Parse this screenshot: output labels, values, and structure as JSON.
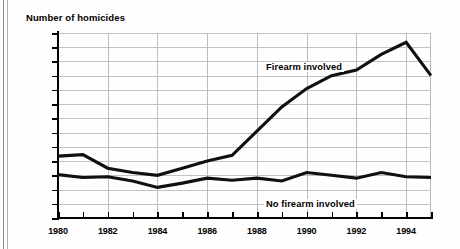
{
  "page": {
    "top_fragment_text": "",
    "title": "Number of homicides"
  },
  "chart_data": {
    "type": "line",
    "title": "Number of homicides",
    "xlabel": "",
    "ylabel": "Number of homicides",
    "x": [
      1980,
      1981,
      1982,
      1983,
      1984,
      1985,
      1986,
      1987,
      1988,
      1989,
      1990,
      1991,
      1992,
      1993,
      1994,
      1995
    ],
    "xlim": [
      1980,
      1995
    ],
    "ylim": [
      0,
      2600
    ],
    "ytick_labels": [
      "2,600",
      "2,400",
      "2,200",
      "2,000",
      "1,800",
      "1,600",
      "1,400",
      "1,200",
      "1,000",
      "800",
      "600",
      "400",
      "200",
      "0"
    ],
    "ytick_values": [
      2600,
      2400,
      2200,
      2000,
      1800,
      1600,
      1400,
      1200,
      1000,
      800,
      600,
      400,
      200,
      0
    ],
    "xtick_values": [
      1980,
      1981,
      1982,
      1983,
      1984,
      1985,
      1986,
      1987,
      1988,
      1989,
      1990,
      1991,
      1992,
      1993,
      1994,
      1995
    ],
    "xtick_labels": [
      "1980",
      "",
      "1982",
      "",
      "1984",
      "",
      "1986",
      "",
      "1988",
      "",
      "1990",
      "",
      "1992",
      "",
      "1994",
      ""
    ],
    "grid": true,
    "legend_position": "inline-annotations",
    "series": [
      {
        "name": "Firearm involved",
        "label_text": "Firearm involved",
        "values": [
          870,
          890,
          700,
          640,
          600,
          700,
          800,
          880,
          1220,
          1560,
          1820,
          2000,
          2080,
          2300,
          2470,
          2000
        ]
      },
      {
        "name": "No firearm involved",
        "label_text": "No firearm involved",
        "values": [
          610,
          570,
          580,
          520,
          430,
          490,
          560,
          530,
          560,
          520,
          640,
          600,
          560,
          640,
          580,
          570
        ]
      }
    ]
  }
}
